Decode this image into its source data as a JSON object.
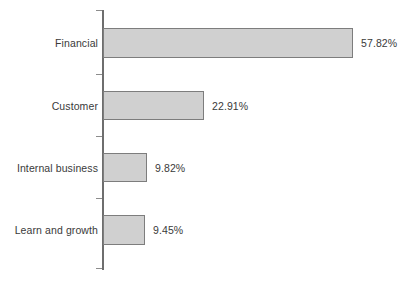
{
  "chart_data": {
    "type": "bar",
    "orientation": "horizontal",
    "title": "",
    "subtitle": "",
    "xlabel": "",
    "ylabel": "",
    "grid": false,
    "legend": null,
    "axis": {
      "y_axis_visible": true,
      "x_axis_visible": false,
      "tick_count": 5
    },
    "xlim": [
      0,
      60
    ],
    "categories": [
      "Financial",
      "Customer",
      "Internal business",
      "Learn and growth"
    ],
    "values": [
      57.82,
      22.91,
      9.82,
      9.45
    ],
    "value_labels": [
      "57.82%",
      "22.91%",
      "9.82%",
      "9.45%"
    ],
    "units": "%",
    "colors": {
      "bar_fill": "#d0d0d0",
      "bar_border": "#7d7d7d",
      "axis": "#6e6e6e",
      "text": "#3a3a3a",
      "background": "#ffffff"
    }
  },
  "bars": [
    {
      "label": "Financial",
      "value": 57.82,
      "value_label": "57.82%",
      "top": 28,
      "height": 30,
      "width": 250
    },
    {
      "label": "Customer",
      "value": 22.91,
      "value_label": "22.91%",
      "top": 91,
      "height": 29,
      "width": 101
    },
    {
      "label": "Internal business",
      "value": 9.82,
      "value_label": "9.82%",
      "top": 153,
      "height": 29,
      "width": 44
    },
    {
      "label": "Learn and growth",
      "value": 9.45,
      "value_label": "9.45%",
      "top": 215,
      "height": 30,
      "width": 42
    }
  ],
  "ticks": [
    {
      "y": 10
    },
    {
      "y": 74
    },
    {
      "y": 136
    },
    {
      "y": 198
    },
    {
      "y": 268
    }
  ]
}
